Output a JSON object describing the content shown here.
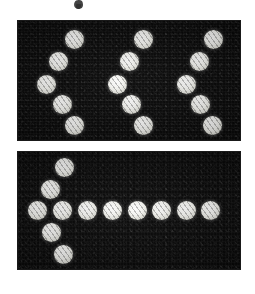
{
  "figure": {
    "page_background": "#ffffff",
    "panel_background": "#0a0a0a",
    "dot_color": "#f4f4ee",
    "canvas": {
      "width": 255,
      "height": 294
    },
    "ink_fragment": {
      "description": "clipped descender of text cropped above the figure",
      "x": 74,
      "y": 0,
      "width": 9,
      "height": 9
    },
    "panels": [
      {
        "id": "panel-top",
        "label": "top panel",
        "x": 18,
        "y": 21,
        "width": 222,
        "height": 119,
        "shape_count": 3,
        "shape_name": "zigzag-five-dot",
        "dot_diameter": 19,
        "groups": [
          {
            "name": "zigzag-group-1",
            "dots": [
              {
                "cx": 74,
                "cy": 39
              },
              {
                "cx": 58,
                "cy": 61
              },
              {
                "cx": 46,
                "cy": 84
              },
              {
                "cx": 62,
                "cy": 104
              },
              {
                "cx": 74,
                "cy": 125
              }
            ]
          },
          {
            "name": "zigzag-group-2",
            "dots": [
              {
                "cx": 143,
                "cy": 39
              },
              {
                "cx": 129,
                "cy": 61
              },
              {
                "cx": 117,
                "cy": 84
              },
              {
                "cx": 131,
                "cy": 104
              },
              {
                "cx": 143,
                "cy": 125
              }
            ]
          },
          {
            "name": "zigzag-group-3",
            "dots": [
              {
                "cx": 213,
                "cy": 39
              },
              {
                "cx": 199,
                "cy": 61
              },
              {
                "cx": 186,
                "cy": 84
              },
              {
                "cx": 200,
                "cy": 104
              },
              {
                "cx": 212,
                "cy": 125
              }
            ]
          }
        ]
      },
      {
        "id": "panel-bottom",
        "label": "bottom panel",
        "x": 18,
        "y": 152,
        "width": 222,
        "height": 117,
        "shape_count": 1,
        "shape_name": "arrow-dot-chain",
        "dot_diameter": 19,
        "groups": [
          {
            "name": "arrowhead-zigzag",
            "dots": [
              {
                "cx": 64,
                "cy": 167
              },
              {
                "cx": 50,
                "cy": 189
              },
              {
                "cx": 37,
                "cy": 210
              },
              {
                "cx": 51,
                "cy": 232
              },
              {
                "cx": 63,
                "cy": 254
              }
            ]
          },
          {
            "name": "arrow-shaft",
            "dots": [
              {
                "cx": 62,
                "cy": 210
              },
              {
                "cx": 87,
                "cy": 210
              },
              {
                "cx": 112,
                "cy": 210
              },
              {
                "cx": 137,
                "cy": 210
              },
              {
                "cx": 161,
                "cy": 210
              },
              {
                "cx": 186,
                "cy": 210
              },
              {
                "cx": 210,
                "cy": 210
              }
            ]
          }
        ]
      }
    ]
  }
}
